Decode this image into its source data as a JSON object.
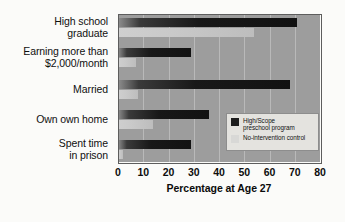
{
  "chart_data": {
    "type": "bar",
    "orientation": "horizontal",
    "title": "",
    "xlabel": "Percentage at Age 27",
    "ylabel": "",
    "xlim": [
      0,
      80
    ],
    "xticks": [
      0,
      10,
      20,
      30,
      40,
      50,
      60,
      70,
      80
    ],
    "grid": true,
    "legend_position": "inside-right-lower",
    "categories": [
      "High school graduate",
      "Earning more than $2,000/month",
      "Married",
      "Own own home",
      "Spent time in prison"
    ],
    "series": [
      {
        "name": "High/Scope preschool program",
        "color": "#1d1d1d",
        "values": [
          71,
          29,
          68,
          36,
          29
        ]
      },
      {
        "name": "No-intervention control",
        "color": "#d8d8d6",
        "values": [
          54,
          7,
          8,
          14,
          2
        ]
      }
    ]
  },
  "category_labels": [
    {
      "lines": [
        "High school",
        "graduate"
      ]
    },
    {
      "lines": [
        "Earning more than",
        "$2,000/month"
      ]
    },
    {
      "lines": [
        "Married"
      ]
    },
    {
      "lines": [
        "Own own home"
      ]
    },
    {
      "lines": [
        "Spent time",
        "in prison"
      ]
    }
  ],
  "legend": {
    "items": [
      {
        "lines": [
          "High/Scope",
          "preschool program"
        ],
        "swatch": "dark"
      },
      {
        "lines": [
          "No-intervention control"
        ],
        "swatch": "light"
      }
    ]
  },
  "axis": {
    "x_title": "Percentage at Age 27",
    "tick_labels": [
      "0",
      "10",
      "20",
      "30",
      "40",
      "50",
      "60",
      "70",
      "80"
    ]
  },
  "colors": {
    "plot_background": "#9d9d9d",
    "page_background": "#fbfbf9",
    "gridline": "#b9b9b9",
    "bar_dark": "#1d1d1d",
    "bar_light": "#d8d8d6",
    "legend_background": "#e4e3df"
  }
}
